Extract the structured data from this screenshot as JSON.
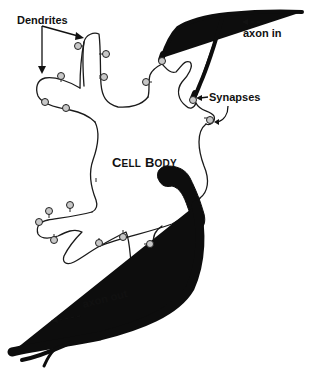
{
  "diagram": {
    "labels": {
      "dendrites": "Dendrites",
      "axon_in": "axon in",
      "synapses": "Synapses",
      "cell_body_first_initial": "C",
      "cell_body_first_rest": "ELL",
      "cell_body_second_initial": "B",
      "cell_body_second_rest": "ODY",
      "cell_body_full": "CELL BODY",
      "axon_out": "axon out"
    },
    "components": [
      {
        "name": "dendrites",
        "description": "Branching extensions of the cell body with knob-shaped synaptic contacts"
      },
      {
        "name": "incoming-axon",
        "description": "Thick black axon entering from top right, branching to form synapses"
      },
      {
        "name": "synapses",
        "description": "Contact points where incoming axon terminals meet the cell"
      },
      {
        "name": "cell-body",
        "description": "Central soma of the neuron"
      },
      {
        "name": "outgoing-axon",
        "description": "Thick black axon leaving the cell body toward bottom left, forked at its end"
      }
    ],
    "flow_direction": {
      "axon_in_arrow": "leftward (dashed)",
      "axon_out_arrow": "leftward (dashed)"
    },
    "colors": {
      "ink": "#111111",
      "knob_fill": "#c8c8c8",
      "background": "#ffffff"
    }
  }
}
